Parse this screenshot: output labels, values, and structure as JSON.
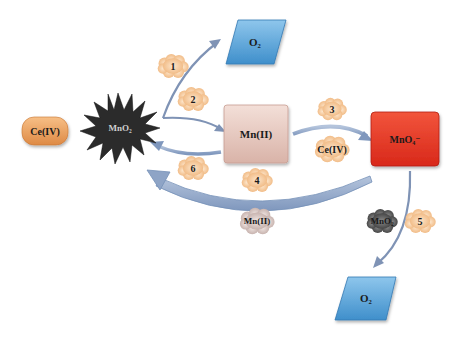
{
  "diagram": {
    "type": "reaction-cycle",
    "nodes": {
      "ce4_start": {
        "label": "Ce(IV)",
        "color": "#e99a55"
      },
      "mno2": {
        "label": "MnO₂",
        "color": "#2a2a2a"
      },
      "o2_top": {
        "label": "O₂",
        "color": "#5aa3d6"
      },
      "mn2": {
        "label": "Mn(II)",
        "color": "#e6c7bd"
      },
      "mno4": {
        "label": "MnO₄⁻",
        "color": "#e63a26"
      },
      "o2_bottom": {
        "label": "O₂",
        "color": "#5aa3d6"
      }
    },
    "steps": {
      "s1": "1",
      "s2": "2",
      "s3": "3",
      "s4": "4",
      "s5": "5",
      "s6": "6"
    },
    "reagents": {
      "ce4_step3": "Ce(IV)",
      "mn2_step4": "Mn(II)",
      "mno2_step5": "MnO₂"
    },
    "edges": [
      {
        "from": "MnO₂",
        "to": "O₂ (top)",
        "step": "1"
      },
      {
        "from": "MnO₂",
        "to": "Mn(II)",
        "step": "2"
      },
      {
        "from": "Mn(II)",
        "to": "MnO₄⁻",
        "step": "3",
        "reagent": "Ce(IV)"
      },
      {
        "from": "MnO₄⁻",
        "to": "MnO₂",
        "step": "4",
        "reagent": "Mn(II)"
      },
      {
        "from": "MnO₄⁻",
        "to": "O₂ (bottom)",
        "step": "5",
        "reagent": "MnO₂"
      },
      {
        "from": "Mn(II)",
        "to": "MnO₂",
        "step": "6"
      }
    ],
    "colors": {
      "arrow": "#8fa3c2",
      "arrow_dark": "#6f86ab",
      "cloud": "#f6c89a",
      "cloud_grey": "#c9b8b4",
      "cloud_dark": "#555555"
    }
  }
}
